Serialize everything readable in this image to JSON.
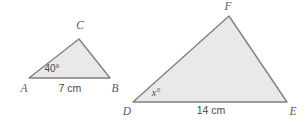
{
  "figure": {
    "background_color": "#ffffff",
    "fill_color": "#e9e9e9",
    "stroke_color": "#808080"
  },
  "triangles": [
    {
      "name": "triangle-abc",
      "polygon_points": "29,78 110,78 79,39",
      "vertices": [
        {
          "label": "A",
          "label_x": 24,
          "label_y": 89,
          "point_x": 29,
          "point_y": 78
        },
        {
          "label": "B",
          "label_x": 115,
          "label_y": 89,
          "point_x": 110,
          "point_y": 78
        },
        {
          "label": "C",
          "label_x": 80,
          "label_y": 26,
          "point_x": 79,
          "point_y": 39
        }
      ],
      "angle": {
        "text": "40°",
        "x": 52,
        "y": 69,
        "italic": false
      },
      "base_measure": {
        "text": "7 cm",
        "x": 70,
        "y": 89
      }
    },
    {
      "name": "triangle-def",
      "polygon_points": "133,102 287,102 229,16",
      "vertices": [
        {
          "label": "D",
          "label_x": 127,
          "label_y": 112,
          "point_x": 133,
          "point_y": 102
        },
        {
          "label": "E",
          "label_x": 293,
          "label_y": 112,
          "point_x": 287,
          "point_y": 102
        },
        {
          "label": "F",
          "label_x": 228,
          "label_y": 7,
          "point_x": 229,
          "point_y": 16
        }
      ],
      "angle": {
        "text": "x°",
        "x": 156,
        "y": 94,
        "italic": true
      },
      "base_measure": {
        "text": "14 cm",
        "x": 211,
        "y": 111
      }
    }
  ]
}
